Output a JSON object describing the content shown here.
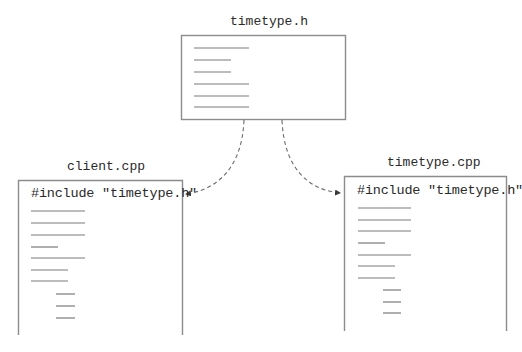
{
  "colors": {
    "background": "#ffffff",
    "box_border": "#8c8c8c",
    "code_line": "#7a7a7a",
    "text": "#2a2a2a",
    "arrow": "#6a6a6a"
  },
  "header_file": {
    "title": "timetype.h",
    "box": {
      "x": 181,
      "y": 35,
      "w": 164,
      "h": 84
    },
    "code_lines": [
      {
        "x1": 194,
        "x2": 249,
        "y": 48
      },
      {
        "x1": 194,
        "x2": 231,
        "y": 60
      },
      {
        "x1": 194,
        "x2": 231,
        "y": 72
      },
      {
        "x1": 194,
        "x2": 249,
        "y": 84
      },
      {
        "x1": 194,
        "x2": 249,
        "y": 96
      },
      {
        "x1": 194,
        "x2": 249,
        "y": 107
      }
    ]
  },
  "client_file": {
    "title": "client.cpp",
    "include_text": "#include \"timetype.h\"",
    "box": {
      "x": 18,
      "y": 180,
      "w": 164,
      "bottom": 335
    },
    "code_lines": [
      {
        "x1": 31,
        "x2": 85,
        "y": 211
      },
      {
        "x1": 31,
        "x2": 85,
        "y": 223
      },
      {
        "x1": 31,
        "x2": 85,
        "y": 235
      },
      {
        "x1": 31,
        "x2": 58,
        "y": 247
      },
      {
        "x1": 31,
        "x2": 85,
        "y": 258
      },
      {
        "x1": 31,
        "x2": 68,
        "y": 270
      },
      {
        "x1": 31,
        "x2": 68,
        "y": 281
      },
      {
        "x1": 56,
        "x2": 75,
        "y": 294
      },
      {
        "x1": 56,
        "x2": 75,
        "y": 306
      },
      {
        "x1": 56,
        "x2": 75,
        "y": 318
      }
    ]
  },
  "impl_file": {
    "title": "timetype.cpp",
    "include_text": "#include \"timetype.h\"",
    "box": {
      "x": 344,
      "y": 176,
      "w": 162,
      "bottom": 331
    },
    "code_lines": [
      {
        "x1": 358,
        "x2": 411,
        "y": 208
      },
      {
        "x1": 358,
        "x2": 411,
        "y": 220
      },
      {
        "x1": 358,
        "x2": 411,
        "y": 231
      },
      {
        "x1": 358,
        "x2": 385,
        "y": 243
      },
      {
        "x1": 358,
        "x2": 411,
        "y": 255
      },
      {
        "x1": 358,
        "x2": 395,
        "y": 266
      },
      {
        "x1": 358,
        "x2": 395,
        "y": 278
      },
      {
        "x1": 383,
        "x2": 401,
        "y": 290
      },
      {
        "x1": 383,
        "x2": 401,
        "y": 302
      },
      {
        "x1": 383,
        "x2": 401,
        "y": 313
      }
    ]
  },
  "arrows": [
    {
      "from": "timetype.h",
      "to": "client.cpp",
      "style": "dashed",
      "path": "M244 120 C 242 170, 215 190, 186 194"
    },
    {
      "from": "timetype.h",
      "to": "timetype.cpp",
      "style": "dashed",
      "path": "M282 120 C 284 170, 310 190, 340 193"
    }
  ]
}
